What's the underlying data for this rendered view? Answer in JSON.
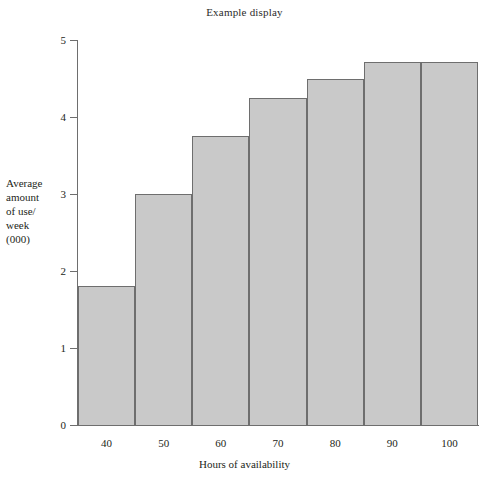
{
  "chart_data": {
    "type": "bar",
    "title": "Example display",
    "xlabel": "Hours of availability",
    "ylabel": "Average amount of use/ week (000)",
    "ylabel_lines": [
      "Average",
      "amount",
      "of use/",
      "week",
      "(000)"
    ],
    "categories": [
      "40",
      "50",
      "60",
      "70",
      "80",
      "90",
      "100"
    ],
    "values": [
      1.8,
      3.0,
      3.75,
      4.25,
      4.5,
      4.72,
      4.72
    ],
    "x": [
      40,
      50,
      60,
      70,
      80,
      90,
      100
    ],
    "xlim": [
      35,
      105
    ],
    "ylim": [
      0,
      5
    ],
    "ytick_labels": [
      "0",
      "1",
      "2",
      "3",
      "4",
      "5"
    ],
    "yticks": [
      0,
      1,
      2,
      3,
      4,
      5
    ],
    "xtick_labels": [
      "40",
      "50",
      "60",
      "70",
      "80",
      "90",
      "100"
    ],
    "grid": false,
    "legend": false,
    "bar_fill_color": "#c9c9c9",
    "bar_edge_color": "#6e6e6e",
    "axis_color": "#6e6e6e",
    "text_color": "#231f20",
    "background_color": "#ffffff"
  }
}
